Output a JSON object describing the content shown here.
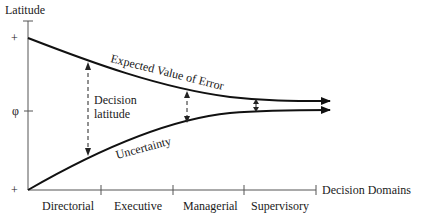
{
  "diagram": {
    "y_axis": {
      "title": "Latitude",
      "ticks": [
        {
          "label": "+",
          "position": "top"
        },
        {
          "label": "φ",
          "position": "middle"
        },
        {
          "label": "+",
          "position": "bottom"
        }
      ]
    },
    "x_axis": {
      "title": "Decision Domains",
      "domains": [
        "Directorial",
        "Executive",
        "Managerial",
        "Supervisory"
      ]
    },
    "curves": {
      "upper": "Expected Value of Error",
      "lower": "Uncertainty"
    },
    "annotation": {
      "line1": "Decision",
      "line2": "latitude"
    },
    "colors": {
      "curve": "#111111",
      "axis": "#555555",
      "text": "#1a1a1a",
      "background": "#ffffff"
    }
  }
}
